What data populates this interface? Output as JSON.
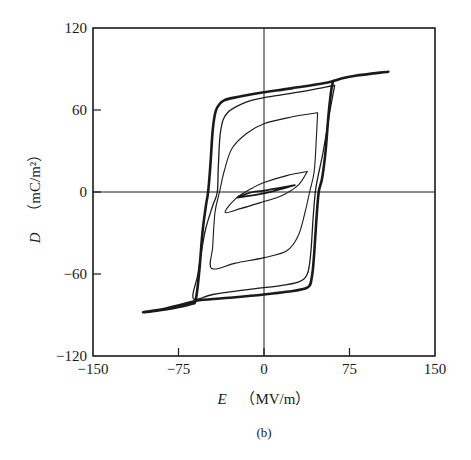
{
  "chart_data": {
    "type": "line",
    "title": "",
    "subcaption": "(b)",
    "xlabel": {
      "var": "E",
      "unit": "（MV/m）"
    },
    "ylabel": {
      "var": "D",
      "unit": "（mC/m²）"
    },
    "xlim": [
      -150,
      150
    ],
    "ylim": [
      -120,
      120
    ],
    "xticks": [
      -150,
      -75,
      0,
      75,
      150
    ],
    "xtick_labels": [
      "−150",
      "−75",
      "0",
      "75",
      "150"
    ],
    "yticks": [
      -120,
      -60,
      0,
      60,
      120
    ],
    "ytick_labels": [
      "−120",
      "−60",
      "0",
      "60",
      "120"
    ],
    "grid": false,
    "zero_lines": true,
    "legend": null,
    "line_color": "#1a1a1a",
    "series": [
      {
        "name": "outer saturated loop (E max ≈ 109 MV/m)",
        "stroke_width": 2.6,
        "points": [
          [
            109,
            88
          ],
          [
            80,
            85
          ],
          [
            64,
            82
          ],
          [
            60,
            79
          ],
          [
            57,
            60
          ],
          [
            54,
            30
          ],
          [
            51,
            10
          ],
          [
            48,
            0
          ],
          [
            46,
            -20
          ],
          [
            44,
            -45
          ],
          [
            42,
            -62
          ],
          [
            38,
            -70
          ],
          [
            20,
            -73
          ],
          [
            0,
            -75
          ],
          [
            -25,
            -77
          ],
          [
            -55,
            -79
          ],
          [
            -61,
            -80
          ],
          [
            -85,
            -85
          ],
          [
            -106,
            -88
          ],
          [
            -80,
            -85
          ],
          [
            -64,
            -82
          ],
          [
            -60,
            -79
          ],
          [
            -57,
            -60
          ],
          [
            -54,
            -30
          ],
          [
            -51,
            -10
          ],
          [
            -49,
            0
          ],
          [
            -47,
            20
          ],
          [
            -45,
            45
          ],
          [
            -42,
            60
          ],
          [
            -35,
            67
          ],
          [
            -20,
            70
          ],
          [
            0,
            73
          ],
          [
            25,
            76
          ],
          [
            55,
            80
          ],
          [
            64,
            82
          ]
        ]
      },
      {
        "name": "second loop (E max ≈ 62 MV/m)",
        "stroke_width": 1.3,
        "points": [
          [
            62,
            78
          ],
          [
            58,
            60
          ],
          [
            52,
            30
          ],
          [
            47,
            10
          ],
          [
            45,
            0
          ],
          [
            43,
            -20
          ],
          [
            41,
            -45
          ],
          [
            38,
            -60
          ],
          [
            30,
            -66
          ],
          [
            10,
            -69
          ],
          [
            0,
            -70
          ],
          [
            -20,
            -72
          ],
          [
            -45,
            -75
          ],
          [
            -62,
            -78
          ],
          [
            -58,
            -60
          ],
          [
            -52,
            -30
          ],
          [
            -45,
            -10
          ],
          [
            -41,
            0
          ],
          [
            -40,
            20
          ],
          [
            -38,
            45
          ],
          [
            -32,
            58
          ],
          [
            -15,
            66
          ],
          [
            0,
            69
          ],
          [
            30,
            73
          ],
          [
            55,
            77
          ],
          [
            62,
            78
          ]
        ]
      },
      {
        "name": "medium loop (E max ≈ 47 MV/m)",
        "stroke_width": 1.1,
        "points": [
          [
            47,
            58
          ],
          [
            46,
            40
          ],
          [
            44,
            15
          ],
          [
            40,
            0
          ],
          [
            36,
            -15
          ],
          [
            30,
            -32
          ],
          [
            20,
            -43
          ],
          [
            0,
            -48
          ],
          [
            -25,
            -52
          ],
          [
            -46,
            -56
          ],
          [
            -45,
            -40
          ],
          [
            -43,
            -15
          ],
          [
            -39,
            0
          ],
          [
            -35,
            15
          ],
          [
            -28,
            32
          ],
          [
            -15,
            43
          ],
          [
            0,
            50
          ],
          [
            25,
            55
          ],
          [
            47,
            58
          ]
        ]
      },
      {
        "name": "small loop (E max ≈ 38 MV/m)",
        "stroke_width": 1.1,
        "points": [
          [
            38,
            15
          ],
          [
            30,
            5
          ],
          [
            15,
            -3
          ],
          [
            0,
            -7
          ],
          [
            -20,
            -12
          ],
          [
            -34,
            -15
          ],
          [
            -25,
            -5
          ],
          [
            -10,
            3
          ],
          [
            0,
            7
          ],
          [
            20,
            12
          ],
          [
            38,
            15
          ]
        ]
      },
      {
        "name": "minor loop (E max ≈ 27 MV/m)",
        "stroke_width": 1.8,
        "points": [
          [
            27,
            5
          ],
          [
            10,
            1
          ],
          [
            0,
            -1
          ],
          [
            -23,
            -4
          ],
          [
            -10,
            0
          ],
          [
            0,
            1
          ],
          [
            27,
            5
          ]
        ]
      }
    ]
  }
}
